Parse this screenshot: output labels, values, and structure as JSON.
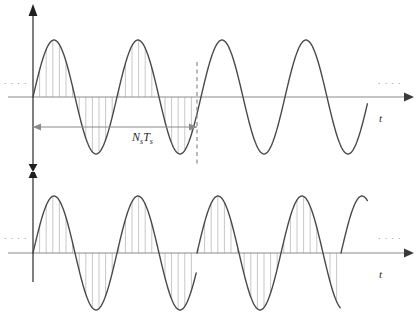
{
  "figure": {
    "ellipsis_glyph": "· · · ·",
    "axis_time_label": "t",
    "interval_label_main": "N",
    "interval_label_sub1": "s",
    "interval_label_main2": "T",
    "interval_label_sub2": "s",
    "colors": {
      "curve": "#4a4a4a",
      "axis": "#8a8a8a",
      "axis_vertical": "#3a3a3a",
      "stem": "#c8c8c8",
      "dashed_marker": "#8a8a8a",
      "arrow_span": "#8a8a8a",
      "text": "#2b2b2b"
    }
  },
  "chart_data": [
    {
      "type": "line",
      "name": "continuous-sampled-sinusoid",
      "title": "",
      "xlabel": "t",
      "ylabel": "",
      "waveform": "sine",
      "amplitude": 57,
      "period_px": 84,
      "cycles": 4,
      "phase": 0,
      "baseline_y": 97,
      "x_start": 33,
      "x_end": 368,
      "grid": false,
      "legend": null,
      "sampling": {
        "stems_visible": true,
        "stem_start_x": 33,
        "stem_end_x": 197,
        "stem_interval_px": 6.6,
        "note": "stems drawn from baseline to curve over first interval only"
      },
      "annotations": [
        {
          "kind": "dashed-vertical-marker",
          "x": 197,
          "y_top": 62,
          "y_bottom": 165
        },
        {
          "kind": "span-arrow",
          "label": "NsTs",
          "x_from": 33,
          "x_to": 197,
          "y": 127,
          "double_headed": true
        }
      ]
    },
    {
      "type": "line",
      "name": "phase-discontinuous-sampled-sinusoid",
      "title": "",
      "xlabel": "t",
      "ylabel": "",
      "waveform": "sine",
      "amplitude": 57,
      "period_px": 84,
      "cycles": 4,
      "phase": 0,
      "baseline_y": 81,
      "x_start": 33,
      "x_end": 368,
      "grid": false,
      "legend": null,
      "sampling": {
        "stems_visible": true,
        "stem_start_x": 33,
        "stem_end_x": 341,
        "stem_interval_px": 6.6,
        "note": "stems span the full signal"
      },
      "discontinuities": [
        197,
        341
      ],
      "annotations": [
        {
          "kind": "phase-reset",
          "x": 197,
          "description": "abrupt vertical jump, waveform restarts"
        },
        {
          "kind": "phase-reset",
          "x": 341,
          "description": "abrupt vertical jump, waveform restarts"
        }
      ]
    }
  ]
}
